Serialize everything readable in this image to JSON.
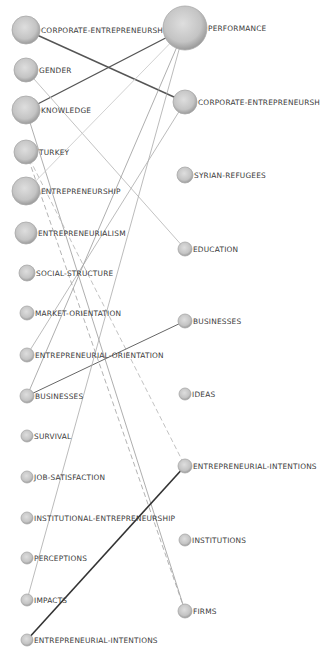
{
  "diagram": {
    "type": "bipartite-keyword-network",
    "left_nodes": [
      {
        "id": "L1",
        "label": "CORPORATE-ENTREPRENEURSH",
        "x": 26,
        "y": 30,
        "r": 14
      },
      {
        "id": "L2",
        "label": "GENDER",
        "x": 26,
        "y": 70,
        "r": 12
      },
      {
        "id": "L3",
        "label": "KNOWLEDGE",
        "x": 26,
        "y": 110,
        "r": 14
      },
      {
        "id": "L4",
        "label": "TURKEY",
        "x": 26,
        "y": 152,
        "r": 12
      },
      {
        "id": "L5",
        "label": "ENTREPRENEURSHIP",
        "x": 26,
        "y": 191,
        "r": 14
      },
      {
        "id": "L6",
        "label": "ENTREPRENEURIALISM",
        "x": 26,
        "y": 233,
        "r": 11
      },
      {
        "id": "L7",
        "label": "SOCIAL-STRUCTURE",
        "x": 27,
        "y": 273,
        "r": 8
      },
      {
        "id": "L8",
        "label": "MARKET-ORIENTATION",
        "x": 27,
        "y": 313,
        "r": 7
      },
      {
        "id": "L9",
        "label": "ENTREPRENEURIAL-ORIENTATION",
        "x": 27,
        "y": 355,
        "r": 7
      },
      {
        "id": "L10",
        "label": "BUSINESSES",
        "x": 27,
        "y": 396,
        "r": 7
      },
      {
        "id": "L11",
        "label": "SURVIVAL",
        "x": 27,
        "y": 436,
        "r": 6
      },
      {
        "id": "L12",
        "label": "JOB-SATISFACTION",
        "x": 27,
        "y": 477,
        "r": 6
      },
      {
        "id": "L13",
        "label": "INSTITUTIONAL-ENTREPRENEURSHIP",
        "x": 27,
        "y": 518,
        "r": 6
      },
      {
        "id": "L14",
        "label": "PERCEPTIONS",
        "x": 27,
        "y": 558,
        "r": 6
      },
      {
        "id": "L15",
        "label": "IMPACTS",
        "x": 27,
        "y": 600,
        "r": 6
      },
      {
        "id": "L16",
        "label": "ENTREPRENEURIAL-INTENTIONS",
        "x": 27,
        "y": 640,
        "r": 6
      }
    ],
    "right_nodes": [
      {
        "id": "R1",
        "label": "PERFORMANCE",
        "x": 185,
        "y": 28,
        "r": 22
      },
      {
        "id": "R2",
        "label": "CORPORATE-ENTREPRENEURSH",
        "x": 185,
        "y": 102,
        "r": 12
      },
      {
        "id": "R3",
        "label": "SYRIAN-REFUGEES",
        "x": 185,
        "y": 175,
        "r": 8
      },
      {
        "id": "R4",
        "label": "EDUCATION",
        "x": 185,
        "y": 249,
        "r": 7
      },
      {
        "id": "R5",
        "label": "BUSINESSES",
        "x": 185,
        "y": 321,
        "r": 7
      },
      {
        "id": "R6",
        "label": "IDEAS",
        "x": 185,
        "y": 394,
        "r": 6
      },
      {
        "id": "R7",
        "label": "ENTREPRENEURIAL-INTENTIONS",
        "x": 185,
        "y": 466,
        "r": 7
      },
      {
        "id": "R8",
        "label": "INSTITUTIONS",
        "x": 185,
        "y": 540,
        "r": 6
      },
      {
        "id": "R9",
        "label": "FIRMS",
        "x": 185,
        "y": 611,
        "r": 7
      }
    ],
    "edges": [
      {
        "from": "L1",
        "to": "R2",
        "style": "solid",
        "color": "#555555",
        "width": 1.4
      },
      {
        "from": "L3",
        "to": "R1",
        "style": "solid",
        "color": "#555555",
        "width": 1.4
      },
      {
        "from": "L2",
        "to": "R4",
        "style": "solid",
        "color": "#bbbbbb",
        "width": 0.9
      },
      {
        "from": "L3",
        "to": "R9",
        "style": "solid",
        "color": "#999999",
        "width": 0.8
      },
      {
        "from": "L4",
        "to": "R7",
        "style": "dashed",
        "color": "#bbbbbb",
        "width": 0.9
      },
      {
        "from": "L4",
        "to": "R9",
        "style": "dashed",
        "color": "#aaaaaa",
        "width": 0.9
      },
      {
        "from": "L5",
        "to": "R1",
        "style": "solid",
        "color": "#cccccc",
        "width": 0.9
      },
      {
        "from": "L9",
        "to": "R2",
        "style": "solid",
        "color": "#aaaaaa",
        "width": 0.8
      },
      {
        "from": "L10",
        "to": "R1",
        "style": "solid",
        "color": "#999999",
        "width": 0.8
      },
      {
        "from": "L10",
        "to": "R5",
        "style": "solid",
        "color": "#666666",
        "width": 1.0
      },
      {
        "from": "L15",
        "to": "R1",
        "style": "solid",
        "color": "#aaaaaa",
        "width": 0.8
      },
      {
        "from": "L16",
        "to": "R7",
        "style": "solid",
        "color": "#333333",
        "width": 1.6
      }
    ],
    "colors": {
      "node_fill_light": "#d9d9d9",
      "node_fill_dark": "#9e9e9e",
      "node_stroke": "#a8a8a8",
      "label": "#3a3a3a",
      "background": "#ffffff"
    }
  }
}
